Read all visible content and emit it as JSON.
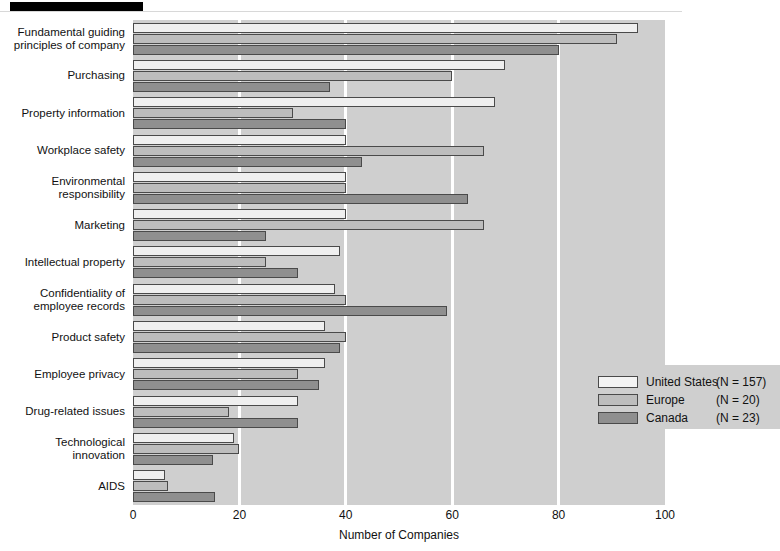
{
  "chart_data": {
    "type": "bar",
    "orientation": "horizontal",
    "title": "",
    "xlabel": "Number of Companies",
    "ylabel": "",
    "xlim": [
      0,
      100
    ],
    "xticks": [
      0,
      20,
      40,
      60,
      80,
      100
    ],
    "xtick_labels": [
      "0",
      "20",
      "40",
      "60",
      "80",
      "100"
    ],
    "grid": "vertical-white-gridlines",
    "legend_position": "lower-right-inside",
    "categories": [
      "Fundamental guiding principles of company",
      "Purchasing",
      "Property information",
      "Workplace safety",
      "Environmental responsibility",
      "Marketing",
      "Intellectual property",
      "Confidentiality of employee records",
      "Product safety",
      "Employee privacy",
      "Drug-related issues",
      "Technological innovation",
      "AIDS"
    ],
    "series": [
      {
        "name": "United States",
        "n": 157,
        "legend_label": "United States",
        "legend_n": "(N = 157)",
        "color": "#efefef",
        "values": [
          95,
          70,
          68,
          40,
          40,
          40,
          39,
          38,
          36,
          36,
          31,
          19,
          6
        ]
      },
      {
        "name": "Europe",
        "n": 20,
        "legend_label": "Europe",
        "legend_n": "(N = 20)",
        "color": "#bdbdbd",
        "values": [
          91,
          60,
          30,
          66,
          40,
          66,
          25,
          40,
          40,
          31,
          18,
          20,
          6.5
        ]
      },
      {
        "name": "Canada",
        "n": 23,
        "legend_label": "Canada",
        "legend_n": "(N = 23)",
        "color": "#8f8f8f",
        "values": [
          80,
          37,
          40,
          43,
          63,
          25,
          31,
          59,
          39,
          35,
          31,
          15,
          15.5
        ]
      }
    ]
  },
  "legend": {
    "rows": [
      {
        "label": "United States",
        "n": "(N = 157)",
        "swatch": "us"
      },
      {
        "label": "Europe",
        "n": "(N = 20)",
        "swatch": "eu"
      },
      {
        "label": "Canada",
        "n": "(N = 23)",
        "swatch": "ca"
      }
    ]
  },
  "axis": {
    "x_label": "Number of Companies",
    "x_ticks": [
      "0",
      "20",
      "40",
      "60",
      "80",
      "100"
    ]
  }
}
